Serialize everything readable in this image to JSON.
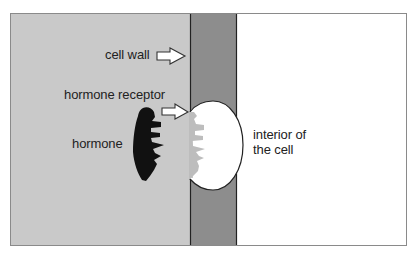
{
  "diagram": {
    "type": "hormone-receptor binding illustration",
    "regions": {
      "exterior": {
        "name": "outside of cell",
        "color": "#c9c9c9"
      },
      "cell_wall": {
        "name": "cell wall",
        "color": "#8d8d8d"
      },
      "interior": {
        "name": "interior of the cell",
        "color": "#ffffff"
      }
    },
    "colors": {
      "outline": "#333333",
      "hormone": "#111111",
      "receptor_teeth": "#bdbdbd",
      "arrow_fill": "#ffffff"
    },
    "labels": {
      "cell_wall": "cell wall",
      "hormone_receptor": "hormone receptor",
      "hormone": "hormone",
      "interior_line1": "interior of",
      "interior_line2": "the cell"
    }
  }
}
